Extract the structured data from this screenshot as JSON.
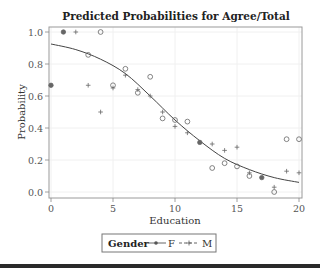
{
  "chart_data": {
    "type": "scatter",
    "title": "Predicted Probabilities for Agree/Total",
    "xlabel": "Education",
    "ylabel": "Probability",
    "xlim": [
      0,
      20
    ],
    "ylim": [
      0,
      1.0
    ],
    "xticks": [
      0,
      5,
      10,
      15,
      20
    ],
    "yticks": [
      0.0,
      0.2,
      0.4,
      0.6,
      0.8,
      1.0
    ],
    "ytick_labels": [
      "0.0",
      "0.2",
      "0.4",
      "0.6",
      "0.8",
      "1.0"
    ],
    "grid": true,
    "legend": {
      "title": "Gender",
      "position": "bottom",
      "entries": [
        {
          "label": "F",
          "marker": "circle",
          "line": "solid"
        },
        {
          "label": "M",
          "marker": "plus",
          "line": "dashed"
        }
      ]
    },
    "series": [
      {
        "name": "F",
        "marker": "circle",
        "x": [
          0,
          1,
          3,
          4,
          5,
          6,
          7,
          8,
          9,
          10,
          11,
          12,
          13,
          14,
          15,
          16,
          17,
          18,
          19,
          20
        ],
        "values": [
          0.667,
          1.0,
          0.857,
          1.0,
          0.667,
          0.77,
          0.62,
          0.72,
          0.46,
          0.45,
          0.44,
          0.31,
          0.15,
          0.18,
          0.16,
          0.1,
          0.09,
          0.0,
          0.33,
          0.33
        ]
      },
      {
        "name": "M",
        "marker": "plus",
        "x": [
          0,
          1,
          2,
          3,
          4,
          5,
          6,
          7,
          8,
          9,
          10,
          11,
          12,
          13,
          14,
          15,
          16,
          17,
          18,
          19,
          20
        ],
        "values": [
          0.667,
          1.0,
          1.0,
          0.667,
          0.5,
          0.65,
          0.73,
          0.64,
          0.6,
          0.5,
          0.41,
          0.37,
          0.31,
          0.3,
          0.26,
          0.28,
          0.12,
          0.09,
          0.03,
          0.13,
          0.12
        ]
      },
      {
        "name": "Fitted",
        "type": "line",
        "x": [
          0,
          2,
          4,
          6,
          8,
          10,
          12,
          14,
          16,
          18,
          20
        ],
        "values": [
          0.925,
          0.89,
          0.83,
          0.74,
          0.6,
          0.45,
          0.32,
          0.21,
          0.14,
          0.09,
          0.06
        ]
      }
    ]
  }
}
